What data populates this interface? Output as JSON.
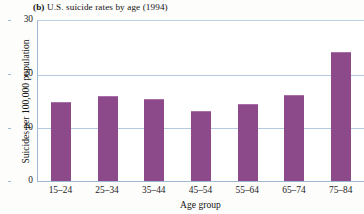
{
  "chart_data": {
    "type": "bar",
    "title": "(b) U.S. suicide rates by age (1994)",
    "panel_letter": "(b)",
    "title_rest": " U.S. suicide rates by age (1994)",
    "xlabel": "Age group",
    "ylabel": "Suicides per 100,000 population",
    "categories": [
      "15–24",
      "25–34",
      "35–44",
      "45–54",
      "55–64",
      "65–74",
      "75–84"
    ],
    "values": [
      14.8,
      15.9,
      15.3,
      13.0,
      14.3,
      16.1,
      24.0
    ],
    "ylim": [
      0,
      30
    ],
    "yticks": [
      0,
      10,
      20,
      30
    ],
    "ytick_labels": [
      "0",
      "10",
      "20",
      "30"
    ],
    "grid": true,
    "grid_axis": "y",
    "legend": false,
    "colors": {
      "bar": "#8c4a8b",
      "bar_highlight": "#a86fa8",
      "gridline": "#b4c9de",
      "axis": "#9fb8d4",
      "text": "#1b1b1b",
      "background": "#ffffff"
    }
  }
}
